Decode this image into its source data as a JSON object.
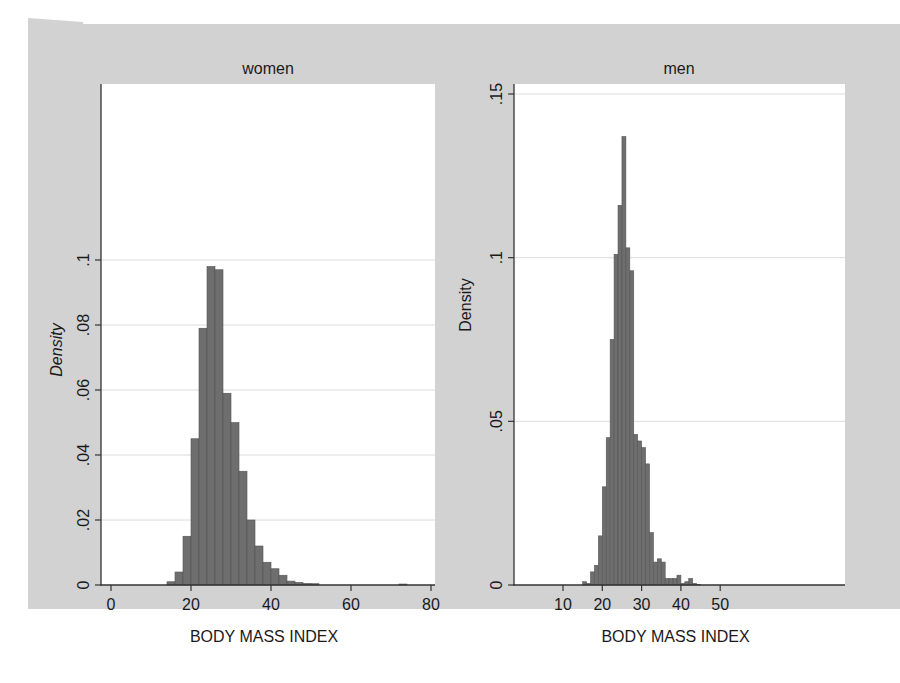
{
  "chart_data": [
    {
      "type": "bar",
      "title": "women",
      "xlabel": "BODY MASS INDEX",
      "ylabel": "Density",
      "xlim": [
        0,
        80
      ],
      "ylim": [
        0,
        0.1
      ],
      "xticks": [
        0,
        20,
        40,
        60,
        80
      ],
      "xtick_labels": [
        "0",
        "20",
        "40",
        "60",
        "80"
      ],
      "yticks": [
        0,
        0.02,
        0.04,
        0.06,
        0.08,
        0.1
      ],
      "ytick_labels": [
        "0",
        ".02",
        ".04",
        ".06",
        ".08",
        ".1"
      ],
      "grid": true,
      "bin_width": 2,
      "bins": [
        14,
        16,
        18,
        20,
        22,
        24,
        26,
        28,
        30,
        32,
        34,
        36,
        38,
        40,
        42,
        44,
        46,
        48,
        50,
        72
      ],
      "values": [
        0.001,
        0.004,
        0.015,
        0.045,
        0.079,
        0.098,
        0.097,
        0.059,
        0.05,
        0.035,
        0.02,
        0.012,
        0.007,
        0.005,
        0.003,
        0.0012,
        0.0008,
        0.0005,
        0.0004,
        0.0003
      ]
    },
    {
      "type": "bar",
      "title": "men",
      "xlabel": "BODY MASS INDEX",
      "ylabel": "Density",
      "xlim": [
        0,
        75
      ],
      "ylim": [
        0,
        0.15
      ],
      "xticks": [
        10,
        20,
        30,
        40,
        50
      ],
      "xtick_labels": [
        "10",
        "20",
        "30",
        "40",
        "50"
      ],
      "yticks": [
        0,
        0.05,
        0.1,
        0.15
      ],
      "ytick_labels": [
        "0",
        ".05",
        ".1",
        ".15"
      ],
      "grid": true,
      "bin_width": 1,
      "bins": [
        15,
        16,
        17,
        18,
        19,
        20,
        21,
        22,
        23,
        24,
        25,
        26,
        27,
        28,
        29,
        30,
        31,
        32,
        33,
        34,
        35,
        36,
        37,
        38,
        39,
        40,
        41,
        42,
        43,
        44
      ],
      "values": [
        0.001,
        0.0005,
        0.004,
        0.006,
        0.015,
        0.03,
        0.045,
        0.075,
        0.101,
        0.116,
        0.137,
        0.103,
        0.096,
        0.046,
        0.044,
        0.042,
        0.037,
        0.016,
        0.007,
        0.008,
        0.007,
        0.002,
        0.002,
        0.002,
        0.003,
        0.0005,
        0.001,
        0.002,
        0.0005,
        0.0002
      ]
    }
  ],
  "colors": {
    "background": "#d2d2d2",
    "plot_area": "#ffffff",
    "bar_fill": "#6e6e6e",
    "bar_edge": "#555555",
    "grid": "#dcdcdc",
    "axis": "#333333",
    "text": "#1a1a1a"
  }
}
